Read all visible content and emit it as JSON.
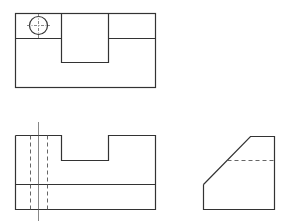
{
  "drawing": {
    "type": "orthographic projection",
    "views": [
      {
        "name": "top view",
        "features": [
          "outer rectangle",
          "center slot",
          "through hole circle",
          "step line"
        ]
      },
      {
        "name": "front view",
        "features": [
          "outer profile with notch",
          "hidden hole lines",
          "hole centerline",
          "step line"
        ]
      },
      {
        "name": "side view",
        "features": [
          "chamfered profile",
          "hidden slot line"
        ]
      }
    ],
    "colors": {
      "line": "#333333",
      "background": "#ffffff"
    }
  }
}
